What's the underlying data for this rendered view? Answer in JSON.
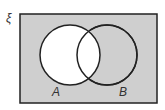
{
  "diagram": {
    "type": "venn",
    "universal_symbol": "ξ",
    "sets": [
      {
        "label": "A"
      },
      {
        "label": "B"
      }
    ],
    "shaded_region": "A'",
    "colors": {
      "shade": "#cfcfcf",
      "unshaded": "#ffffff",
      "stroke": "#222222"
    }
  }
}
